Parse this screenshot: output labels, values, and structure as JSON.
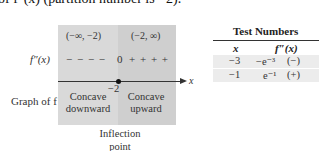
{
  "caption_fragment": "of f″(x) (partition number is −2).",
  "sign_chart": {
    "intervals": [
      "(−∞, −2)",
      "(−2, ∞)"
    ],
    "row_label": "f″(x)",
    "signs_left": "− − − −",
    "zero_mark": "0",
    "signs_right": "+ + + +",
    "axis_variable": "x",
    "partition_value": "−2",
    "graph_label": "Graph of f",
    "concavity_left": [
      "Concave",
      "downward"
    ],
    "concavity_right": [
      "Concave",
      "upward"
    ],
    "point_label": [
      "Inflection",
      "point"
    ],
    "colors": {
      "left_region": "#d9d9d9",
      "right_region": "#cfcfcf"
    }
  },
  "test_table": {
    "title": "Test Numbers",
    "columns": [
      "x",
      "f″(x)"
    ],
    "rows": [
      {
        "x": "−3",
        "value": "−e⁻³",
        "sign": "(−)"
      },
      {
        "x": "−1",
        "value": "e⁻¹",
        "sign": "(+)"
      }
    ]
  }
}
